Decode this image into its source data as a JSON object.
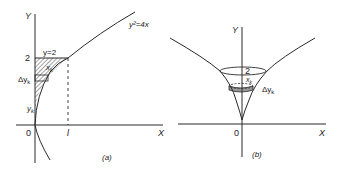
{
  "figure_a": {
    "caption": "(a)",
    "y_axis_label": "Y",
    "x_axis_label": "X",
    "origin_label": "0",
    "curve_label": "y²=4x",
    "line_label": "y=2",
    "y_tick_label": "2",
    "x_tick_label": "l",
    "strip_x_label": "x",
    "strip_x_sub": "k",
    "delta_y_label": "Δy",
    "delta_y_sub": "k",
    "yk_label": "y",
    "yk_sub": "k"
  },
  "figure_b": {
    "caption": "(b)",
    "y_axis_label": "Y",
    "x_axis_label": "X",
    "origin_label": "0",
    "top_label": "2",
    "radius_label": "x",
    "radius_sub": "k",
    "delta_y_label": "Δy",
    "delta_y_sub": "k"
  },
  "colors": {
    "stroke": "#2a2a2a",
    "text": "#222222",
    "background": "#ffffff"
  }
}
